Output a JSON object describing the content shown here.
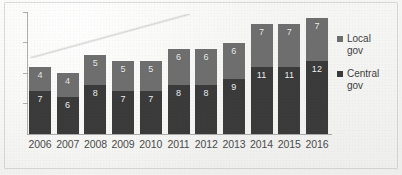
{
  "chart_data": {
    "type": "bar",
    "stacked": true,
    "title": "",
    "subtitle": "",
    "xlabel": "",
    "ylabel": "",
    "categories": [
      "2006",
      "2007",
      "2008",
      "2009",
      "2010",
      "2011",
      "2012",
      "2013",
      "2014",
      "2015",
      "2016"
    ],
    "series": [
      {
        "name": "Central gov",
        "color": "#3a3a3a",
        "values": [
          7,
          6,
          8,
          7,
          7,
          8,
          8,
          9,
          11,
          11,
          12
        ]
      },
      {
        "name": "Local gov",
        "color": "#6e6e6e",
        "values": [
          4,
          4,
          5,
          5,
          5,
          6,
          6,
          6,
          7,
          7,
          7
        ]
      }
    ],
    "totals": [
      11,
      10,
      13,
      12,
      12,
      14,
      14,
      15,
      18,
      18,
      19
    ],
    "ylim": [
      0,
      20
    ],
    "y_tick_labels": [],
    "grid": false,
    "data_labels": true,
    "legend_position": "right"
  },
  "legend": {
    "items": [
      {
        "label_line1": "Local",
        "label_line2": "gov",
        "color": "#6e6e6e",
        "name": "local-gov"
      },
      {
        "label_line1": "Central",
        "label_line2": "gov",
        "color": "#3a3a3a",
        "name": "central-gov"
      }
    ]
  },
  "axis": {
    "x_labels": [
      "2006",
      "2007",
      "2008",
      "2009",
      "2010",
      "2011",
      "2012",
      "2013",
      "2014",
      "2015",
      "2016"
    ]
  }
}
